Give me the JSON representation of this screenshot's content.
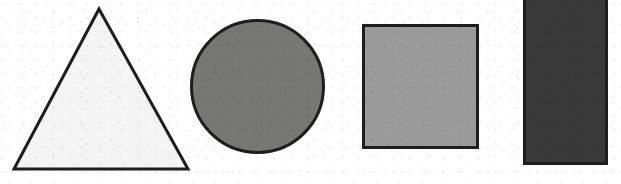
{
  "figure": {
    "background_color": "#ffffff",
    "width": 621,
    "height": 184,
    "outline_color": "#1e1e1e",
    "shape_count": 4
  },
  "shapes": [
    {
      "name": "triangle",
      "label": "triangle",
      "fill_color": "#f4f4f4",
      "stroke_color": "#1e1e1e",
      "stroke_width": 3,
      "points": "99,9 188,169 14,169",
      "bbox": {
        "x": 14,
        "y": 9,
        "width": 174,
        "height": 160
      }
    },
    {
      "name": "circle",
      "label": "circle",
      "fill_color": "#777776",
      "stroke_color": "#1e1e1e",
      "stroke_width": 3,
      "cx": 257.5,
      "cy": 86.5,
      "rx": 66,
      "ry": 66,
      "bbox": {
        "x": 190,
        "y": 19,
        "width": 135,
        "height": 135
      }
    },
    {
      "name": "square",
      "label": "square",
      "fill_color": "#9b9b9b",
      "stroke_color": "#1e1e1e",
      "stroke_width": 3,
      "bbox": {
        "x": 362,
        "y": 24,
        "width": 117,
        "height": 125
      }
    },
    {
      "name": "rectangle",
      "label": "rectangle",
      "fill_color": "#3a3a3a",
      "stroke_color": "#1e1e1e",
      "stroke_width": 3,
      "clipped_edge": "top",
      "bbox": {
        "x": 523,
        "y": -6,
        "width": 85,
        "height": 171
      }
    }
  ]
}
